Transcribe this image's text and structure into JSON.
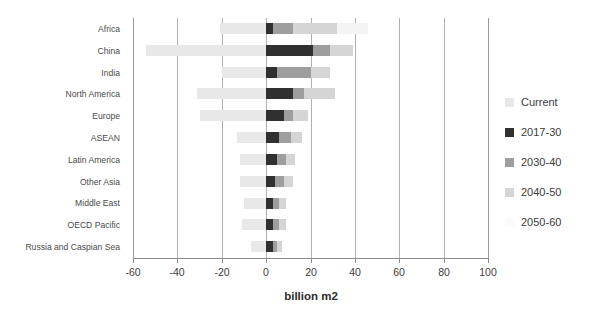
{
  "chart_data": {
    "type": "bar",
    "orientation": "horizontal",
    "stacked": true,
    "title": "",
    "xlabel": "billion m2",
    "ylabel": "",
    "xlim": [
      -60,
      100
    ],
    "xticks": [
      -60,
      -40,
      -20,
      0,
      20,
      40,
      60,
      80,
      100
    ],
    "xticklabels": [
      "-60",
      "-40",
      "-20",
      "0",
      "20",
      "40",
      "60",
      "80",
      "100"
    ],
    "grid": true,
    "grid_axis": "x",
    "legend_position": "right",
    "categories": [
      "Africa",
      "China",
      "India",
      "North America",
      "Europe",
      "ASEAN",
      "Latin America",
      "Other Asia",
      "Middle East",
      "OECD Pacific",
      "Russia and Caspian Sea"
    ],
    "series": [
      {
        "name": "Current",
        "color": "#e8e8e8",
        "values": [
          -21,
          -54,
          -20,
          -31,
          -30,
          -13,
          -12,
          -12,
          -10,
          -11,
          -7
        ]
      },
      {
        "name": "2017-30",
        "color": "#303030",
        "values": [
          3,
          21,
          5,
          12,
          8,
          6,
          5,
          4,
          3,
          3,
          3
        ]
      },
      {
        "name": "2030-40",
        "color": "#9e9e9e",
        "values": [
          9,
          8,
          15,
          5,
          4,
          5,
          4,
          4,
          3,
          3,
          2
        ]
      },
      {
        "name": "2040-50",
        "color": "#d5d5d5",
        "values": [
          20,
          10,
          9,
          14,
          7,
          5,
          4,
          4,
          3,
          3,
          2
        ]
      },
      {
        "name": "2050-60",
        "color": "#f4f4f4",
        "values": [
          14,
          0,
          0,
          0,
          0,
          0,
          0,
          0,
          0,
          0,
          0
        ]
      }
    ]
  },
  "legend": {
    "items": [
      {
        "label": "Current",
        "color": "#e8e8e8"
      },
      {
        "label": "2017-30",
        "color": "#303030"
      },
      {
        "label": "2030-40",
        "color": "#9e9e9e"
      },
      {
        "label": "2040-50",
        "color": "#d5d5d5"
      },
      {
        "label": "2050-60",
        "color": "#fbfbfb"
      }
    ]
  },
  "axis": {
    "x_title": "billion m2"
  }
}
